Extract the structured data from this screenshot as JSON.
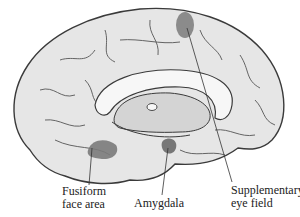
{
  "diagram": {
    "labels": [
      {
        "id": "fusiform",
        "line1": "Fusiform",
        "line2": "face area"
      },
      {
        "id": "amygdala",
        "line1": "Amygdala"
      },
      {
        "id": "sef",
        "line1": "Supplementary",
        "line2": "eye field"
      }
    ],
    "colors": {
      "cortex": "#e6e6e6",
      "outline": "#3a3a3a",
      "highlight": "#7a7a7a",
      "white_matter": "#f7f7f7",
      "inner": "#d4d4d4"
    }
  }
}
